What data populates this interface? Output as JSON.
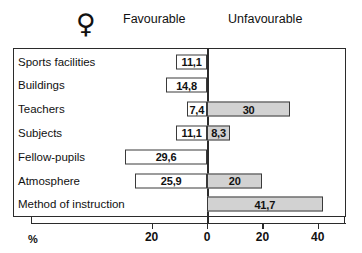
{
  "header": {
    "gender_symbol": "♀",
    "gender_symbol_name": "female-venus-symbol",
    "favourable_label": "Favourable",
    "unfavourable_label": "Unfavourable"
  },
  "axis": {
    "unit_label": "%",
    "tick_labels": [
      "20",
      "0",
      "20",
      "40"
    ],
    "tick_values": [
      -20,
      0,
      20,
      40
    ]
  },
  "colors": {
    "favourable_fill": "#ffffff",
    "unfavourable_fill": "#d2d2d2",
    "stroke": "#3a3a3a",
    "text": "#111111"
  },
  "chart_data": {
    "type": "bar",
    "title": "",
    "subtitle": "",
    "xlabel": "%",
    "ylabel": "",
    "orientation": "horizontal",
    "layout": "diverging",
    "grid": false,
    "legend_position": "top",
    "xlim": [
      -32,
      50
    ],
    "categories": [
      "Sports facilities",
      "Buildings",
      "Teachers",
      "Subjects",
      "Fellow-pupils",
      "Atmosphere",
      "Method of instruction"
    ],
    "series": [
      {
        "name": "Favourable",
        "direction": "left",
        "values": [
          11.1,
          14.8,
          7.4,
          11.1,
          29.6,
          25.9,
          0
        ],
        "labels": [
          "11,1",
          "14,8",
          "7,4",
          "11,1",
          "29,6",
          "25,9",
          ""
        ]
      },
      {
        "name": "Unfavourable",
        "direction": "right",
        "values": [
          0,
          0,
          30,
          8.3,
          0,
          20,
          41.7
        ],
        "labels": [
          "",
          "",
          "30",
          "8,3",
          "",
          "20",
          "41,7"
        ]
      }
    ]
  }
}
